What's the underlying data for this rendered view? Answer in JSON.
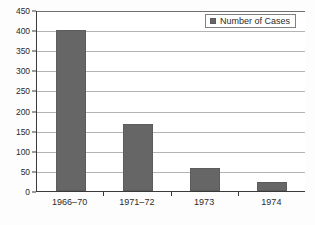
{
  "chart_data": {
    "type": "bar",
    "title": "",
    "subtitle": "",
    "xlabel": "",
    "ylabel": "",
    "categories": [
      "1966–70",
      "1971–72",
      "1973",
      "1974"
    ],
    "series": [
      {
        "name": "Number of Cases",
        "values": [
          400,
          167,
          57,
          22
        ],
        "color": "#666666"
      }
    ],
    "ylim": [
      0,
      450
    ],
    "yticks": [
      0,
      50,
      100,
      150,
      200,
      250,
      300,
      350,
      400,
      450
    ],
    "ytick_labels": [
      "0",
      "50",
      "100",
      "150",
      "200",
      "250",
      "300",
      "350",
      "400",
      "450"
    ],
    "grid": true,
    "grid_axis": "y",
    "legend": {
      "visible": true,
      "position": "top-right",
      "entries": [
        {
          "label": "Number of Cases",
          "color": "#666666",
          "swatch": "square-swatch"
        }
      ]
    },
    "annotations": [],
    "colors": {
      "bar": "#666666",
      "bar_edge": "#5c5c5c",
      "grid": "#b4b4b4",
      "axis": "#3a3a3a",
      "plot_background": "#ffffff",
      "figure_background": "#fdfdfd",
      "text": "#2b2b2b",
      "legend_border": "#808080"
    }
  },
  "caption": {
    "remnant_text": ". . . . . . . . . . . . . . . . . . . . . . . . . . . . . . . . . . . ."
  }
}
